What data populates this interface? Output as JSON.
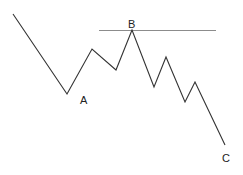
{
  "diagram": {
    "type": "price-wave-pattern",
    "colors": {
      "wave": "#333333",
      "level_line": "#8c8c8c",
      "label": "#222222",
      "background": "#ffffff"
    },
    "labels": {
      "a": "A",
      "b": "B",
      "c": "C"
    },
    "points_description": "zigzag: decline to A, rally to B touching horizontal resistance, decline in waves to C"
  }
}
